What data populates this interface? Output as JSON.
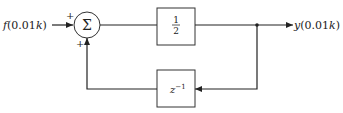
{
  "diagram": {
    "type": "block-diagram",
    "input": {
      "label": "f(0.01k)",
      "func": "f",
      "arg": "(0.01",
      "k": "k",
      "close": ")"
    },
    "output": {
      "label": "y(0.01k)",
      "func": "y",
      "arg": "(0.01",
      "k": "k",
      "close": ")"
    },
    "summer": {
      "symbol": "Σ",
      "input_sign_top": "+",
      "input_sign_bottom": "+"
    },
    "forward_block": {
      "label": "1/2",
      "numerator": "1",
      "denominator": "2"
    },
    "feedback_block": {
      "label": "z^-1",
      "base": "z",
      "exponent": "−1"
    },
    "colors": {
      "line": "#222222",
      "background": "#ffffff"
    }
  }
}
